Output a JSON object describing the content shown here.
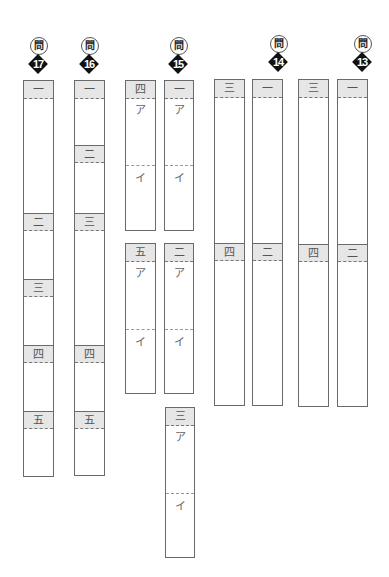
{
  "question_prefix": "問",
  "questions": [
    {
      "number": "17",
      "sections": [
        "一",
        "二",
        "三",
        "四",
        "五"
      ]
    },
    {
      "number": "16",
      "sections": [
        "一",
        "二",
        "三",
        "四",
        "五"
      ]
    },
    {
      "number": "15",
      "sections": [
        {
          "label": "一",
          "parts": [
            "ア",
            "イ"
          ]
        },
        {
          "label": "二",
          "parts": [
            "ア",
            "イ"
          ]
        },
        {
          "label": "三",
          "parts": [
            "ア",
            "イ"
          ]
        },
        {
          "label": "四",
          "parts": [
            "ア",
            "イ"
          ]
        },
        {
          "label": "五",
          "parts": [
            "ア",
            "イ"
          ]
        }
      ]
    },
    {
      "number": "14",
      "sections": [
        "一",
        "二",
        "三",
        "四"
      ]
    },
    {
      "number": "13",
      "sections": [
        "一",
        "二",
        "三",
        "四"
      ]
    }
  ]
}
